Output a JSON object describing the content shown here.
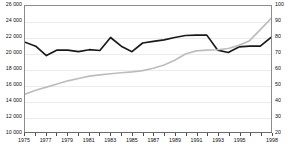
{
  "chart_data": {
    "type": "line",
    "title": "",
    "subtitle": "",
    "xlabel": "",
    "ylabel": "",
    "grid": true,
    "legend_position": "none",
    "x": [
      1975,
      1976,
      1977,
      1978,
      1979,
      1980,
      1981,
      1982,
      1983,
      1984,
      1985,
      1986,
      1987,
      1988,
      1989,
      1990,
      1991,
      1992,
      1993,
      1994,
      1995,
      1996,
      1997,
      1998
    ],
    "xtick_labels": [
      "1975",
      "1977",
      "1979",
      "1981",
      "1983",
      "1985",
      "1987",
      "1989",
      "1991",
      "1993",
      "1995",
      "1998"
    ],
    "xtick_values": [
      1975,
      1977,
      1979,
      1981,
      1983,
      1985,
      1987,
      1989,
      1991,
      1993,
      1995,
      1998
    ],
    "xlim": [
      1975,
      1998
    ],
    "left_axis": {
      "ylim": [
        10000,
        26000
      ],
      "ytick_values": [
        10000,
        12000,
        14000,
        16000,
        18000,
        20000,
        22000,
        24000,
        26000
      ],
      "ytick_labels": [
        "10 000",
        "12 000",
        "14 000",
        "16 000",
        "18 000",
        "20 000",
        "22 000",
        "24 000",
        "26 000"
      ]
    },
    "right_axis": {
      "ylim": [
        20,
        100
      ],
      "ytick_values": [
        20,
        30,
        40,
        50,
        60,
        70,
        80,
        90,
        100
      ],
      "ytick_labels": [
        "20",
        "30",
        "40",
        "50",
        "60",
        "70",
        "80",
        "90",
        "100"
      ]
    },
    "series": [
      {
        "name": "black-series",
        "axis": "left",
        "color": "#1a1a1a",
        "width": 1.7,
        "values": [
          21400,
          20900,
          19700,
          20400,
          20400,
          20200,
          20450,
          20350,
          22000,
          20900,
          20200,
          21300,
          21500,
          21700,
          22000,
          22250,
          22300,
          22300,
          20400,
          20100,
          20800,
          20900,
          20900,
          22000
        ]
      },
      {
        "name": "gray-series",
        "axis": "right",
        "color": "#bdbdbd",
        "width": 1.7,
        "values": [
          44.0,
          46.5,
          48.5,
          50.5,
          52.5,
          54.0,
          55.5,
          56.3,
          57.0,
          57.6,
          58.2,
          59.0,
          60.5,
          62.5,
          65.5,
          69.5,
          71.5,
          72.0,
          72.2,
          73.0,
          75.0,
          78.0,
          85.0,
          92.0
        ]
      }
    ]
  }
}
